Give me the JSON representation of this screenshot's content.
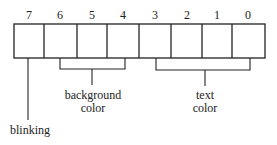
{
  "diagram": {
    "bits": [
      "7",
      "6",
      "5",
      "4",
      "3",
      "2",
      "1",
      "0"
    ],
    "groups": [
      {
        "label_line1": "background",
        "label_line2": "color",
        "bits": [
          "6",
          "5",
          "4"
        ]
      },
      {
        "label_line1": "text",
        "label_line2": "color",
        "bits": [
          "3",
          "2",
          "1",
          "0"
        ]
      }
    ],
    "blink": {
      "label": "blinking",
      "bit": "7"
    },
    "line_color": "#222222"
  }
}
